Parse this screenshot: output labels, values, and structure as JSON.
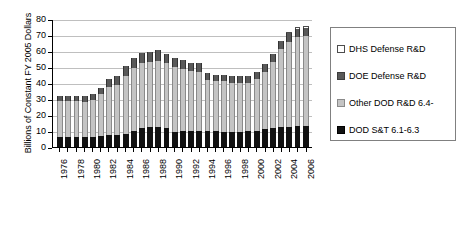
{
  "chart_data": {
    "type": "bar",
    "stacked": true,
    "title": "",
    "xlabel": "",
    "ylabel": "Billions of Constant FY 2005 Dollars",
    "ylim": [
      0,
      80
    ],
    "ytick_values": [
      0,
      10,
      20,
      30,
      40,
      50,
      60,
      70,
      80
    ],
    "ytick_labels": [
      "0",
      "10",
      "20",
      "30",
      "40",
      "50",
      "60",
      "70",
      "80"
    ],
    "grid": true,
    "grid_axis": "y",
    "legend_position": "right",
    "categories": [
      "1976",
      "1977",
      "1978",
      "1979",
      "1980",
      "1981",
      "1982",
      "1983",
      "1984",
      "1985",
      "1986",
      "1987",
      "1988",
      "1989",
      "1990",
      "1991",
      "1992",
      "1993",
      "1994",
      "1995",
      "1996",
      "1997",
      "1998",
      "1999",
      "2000",
      "2001",
      "2002",
      "2003",
      "2004",
      "2005",
      "2006"
    ],
    "xtick_labels_shown": [
      "1976",
      "",
      "1978",
      "",
      "1980",
      "",
      "1982",
      "",
      "1984",
      "",
      "1986",
      "",
      "1988",
      "",
      "1990",
      "",
      "1992",
      "",
      "1994",
      "",
      "1996",
      "",
      "1998",
      "",
      "2000",
      "",
      "2002",
      "",
      "2004",
      "",
      "2006"
    ],
    "series": [
      {
        "name": "DOD S&T 6.1-6.3",
        "color": "#121212",
        "values": [
          6.2,
          6.0,
          6.0,
          6.0,
          6.2,
          6.6,
          7.2,
          7.4,
          8.2,
          9.8,
          11.8,
          12.3,
          12.6,
          11.6,
          9.3,
          9.8,
          10.0,
          9.8,
          10.2,
          9.8,
          9.2,
          9.1,
          9.5,
          9.8,
          10.3,
          11.0,
          11.8,
          12.6,
          12.8,
          13.1,
          13.2
        ]
      },
      {
        "name": "Other DOD R&D 6.4-",
        "color": "#c4c4c4",
        "values": [
          22.6,
          22.5,
          22.8,
          22.4,
          23.3,
          26.7,
          30.2,
          31.4,
          36.0,
          39.3,
          40.5,
          40.6,
          41.0,
          41.2,
          40.6,
          38.9,
          37.3,
          37.2,
          31.8,
          31.4,
          31.8,
          31.0,
          30.8,
          30.4,
          32.1,
          36.0,
          41.3,
          48.5,
          53.1,
          55.6,
          56.0
        ]
      },
      {
        "name": "DOE Defense R&D",
        "color": "#595959",
        "values": [
          3.2,
          3.3,
          3.4,
          3.4,
          3.6,
          3.9,
          5.2,
          5.5,
          6.2,
          6.4,
          6.2,
          6.3,
          6.8,
          5.6,
          5.8,
          5.5,
          5.5,
          5.5,
          4.3,
          3.9,
          4.0,
          4.2,
          4.3,
          4.5,
          4.7,
          4.6,
          4.8,
          5.0,
          5.2,
          5.2,
          5.3
        ]
      },
      {
        "name": "DHS Defense R&D",
        "color": "#ffffff",
        "values": [
          0,
          0,
          0,
          0,
          0,
          0,
          0,
          0,
          0,
          0,
          0,
          0,
          0,
          0,
          0,
          0,
          0,
          0,
          0,
          0,
          0,
          0,
          0,
          0,
          0,
          0,
          0,
          0,
          0.7,
          1.1,
          1.2
        ]
      }
    ],
    "totals": [
      32.0,
      31.8,
      32.2,
      31.8,
      33.1,
      37.2,
      42.6,
      44.3,
      50.4,
      55.5,
      58.5,
      59.2,
      60.4,
      58.4,
      55.7,
      54.2,
      52.8,
      52.5,
      46.3,
      45.1,
      45.0,
      44.3,
      44.6,
      44.7,
      47.1,
      51.6,
      57.9,
      66.1,
      71.8,
      75.0,
      75.7
    ]
  },
  "legend": {
    "items": [
      {
        "label": "DHS Defense R&D",
        "swatch": "sw-dhs"
      },
      {
        "label": "DOE Defense R&D",
        "swatch": "sw-doe"
      },
      {
        "label": "Other DOD R&D 6.4-",
        "swatch": "sw-other"
      },
      {
        "label": "DOD S&T 6.1-6.3",
        "swatch": "sw-st"
      }
    ]
  }
}
